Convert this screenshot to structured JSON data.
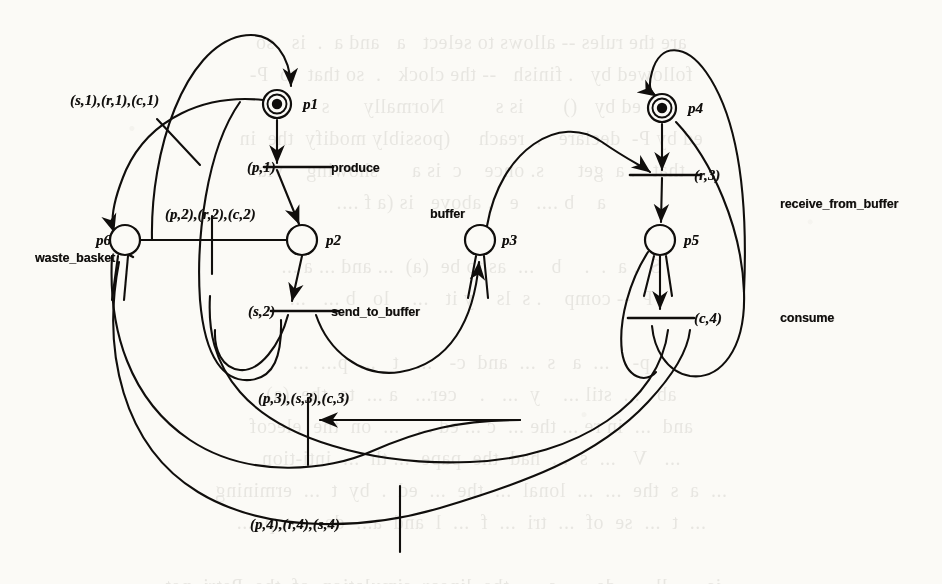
{
  "figure": {
    "kind": "petri-net",
    "ink_color": "#100e0c",
    "paper_color": "#fbfaf6"
  },
  "places": [
    {
      "id": "p1",
      "label": "p1",
      "cx": 277,
      "cy": 104,
      "r": 14,
      "double": true,
      "token": true
    },
    {
      "id": "p2",
      "label": "p2",
      "cx": 302,
      "cy": 240,
      "r": 15,
      "double": false,
      "token": false
    },
    {
      "id": "p3",
      "label": "p3",
      "cx": 480,
      "cy": 240,
      "r": 15,
      "double": false,
      "token": false
    },
    {
      "id": "p4",
      "label": "p4",
      "cx": 662,
      "cy": 108,
      "r": 14,
      "double": true,
      "token": true
    },
    {
      "id": "p5",
      "label": "p5",
      "cx": 660,
      "cy": 240,
      "r": 15,
      "double": false,
      "token": false
    },
    {
      "id": "p6",
      "label": "p6",
      "cx": 125,
      "cy": 240,
      "r": 15,
      "double": false,
      "token": false
    }
  ],
  "transitions": [
    {
      "id": "t_produce",
      "name": "produce",
      "guard": "(p,1)"
    },
    {
      "id": "t_send_to_buffer",
      "name": "send_to_buffer",
      "guard": "(s,2)"
    },
    {
      "id": "t_receive_from_buffer",
      "name": "receive_from_buffer",
      "guard": "(r,3)"
    },
    {
      "id": "t_consume",
      "name": "consume",
      "guard": "(c,4)"
    },
    {
      "id": "t_waste_basket",
      "name": "waste_basket",
      "guard": ""
    }
  ],
  "arc_labels": [
    {
      "id": "a1",
      "text": "(s,1),(r,1),(c,1)",
      "x": 70,
      "y": 92
    },
    {
      "id": "a2",
      "text": "(p,1)",
      "x": 247,
      "y": 159
    },
    {
      "id": "a3",
      "text": "(p,2),(r,2),(c,2)",
      "x": 165,
      "y": 206
    },
    {
      "id": "a4",
      "text": "(s,2)",
      "x": 248,
      "y": 303
    },
    {
      "id": "a5",
      "text": "(r,3)",
      "x": 694,
      "y": 167
    },
    {
      "id": "a6",
      "text": "(c,4)",
      "x": 694,
      "y": 310
    },
    {
      "id": "a7",
      "text": "(p,3),(s,3),(c,3)",
      "x": 258,
      "y": 390
    },
    {
      "id": "a8",
      "text": "(p,4),(r,4),(s,4)",
      "x": 250,
      "y": 516
    }
  ],
  "transition_names": [
    {
      "id": "n_produce",
      "text": "produce",
      "x": 331,
      "y": 161
    },
    {
      "id": "n_send_to_buffer",
      "text": "send_to_buffer",
      "x": 331,
      "y": 305
    },
    {
      "id": "n_receive_from_buffer",
      "text": "receive_from_buffer",
      "x": 780,
      "y": 197
    },
    {
      "id": "n_consume",
      "text": "consume",
      "x": 780,
      "y": 311
    },
    {
      "id": "n_waste_basket",
      "text": "waste_basket",
      "x": 35,
      "y": 251
    },
    {
      "id": "n_buffer",
      "text": "buffer",
      "x": 430,
      "y": 207
    }
  ],
  "place_names": [
    {
      "id": "l_p1",
      "text": "p1",
      "x": 303,
      "y": 96
    },
    {
      "id": "l_p2",
      "text": "p2",
      "x": 326,
      "y": 232
    },
    {
      "id": "l_p3",
      "text": "p3",
      "x": 502,
      "y": 232
    },
    {
      "id": "l_p4",
      "text": "p4",
      "x": 688,
      "y": 100
    },
    {
      "id": "l_p5",
      "text": "p5",
      "x": 684,
      "y": 232
    },
    {
      "id": "l_p6",
      "text": "p6",
      "x": 96,
      "y": 232
    }
  ],
  "ghost_text": {
    "lines": [
      "are the rules -- allows to select   a   and a  .  is   so",
      "followed by   . finish   -- the clock   .  so that  to  P-",
      "ed by   ()       is s         Normally      s --",
      "ed by P-  declare   .  reach     (possibly modify  the  in",
      "that   . a  get      s. once    c  is a      showing    via",
      "a    b ....   e   . above   is (a f ....",
      "",
      "S  . a  .  .    b   ...  as to be  (a)  ... and ... a ...",
      "P  -- comp    . s  ls    y it   ...    lo   b ...   ...",
      "",
      "p-    ...  a   s  ...  and  c-   ...   t   ...  p...  ...",
      "ab   ...  stil ...    y  ...   .    cer...   a ...  to  the  (a)",
      "and  ...  in re ... the ...  c ... ed ...   ...  on  the  elecof",
      "...   V   ...  s  ...  had  the  pape  ... th  ...  inti-tion",
      "...  a  s  the  ...  ...  lonal  ...  the  ...  ed  .  by  t  ...  ermining",
      "...  t  ...  se  of  ...  tri  ...  f  ...  l  and  a...  de  ...  op  ...",
      "",
      "...  ...  is  ...  ll  ...  de  ...  s  ...  the  linear  simulation  of  the  Petri  net"
    ]
  }
}
